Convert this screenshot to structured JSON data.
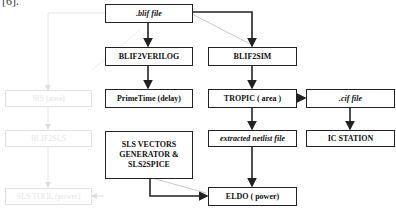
{
  "reference_fragment": "[6].",
  "nodes": {
    "blif_file": {
      "label": ".blif file"
    },
    "blif2verilog": {
      "label": "BLIF2VERILOG"
    },
    "primetime": {
      "label": "PrimeTime (delay)"
    },
    "blif2sim": {
      "label": "BLIF2SIM"
    },
    "tropic": {
      "label": "TROPIC ( area )"
    },
    "cif_file": {
      "label": ".cif file"
    },
    "extracted_netlist": {
      "label": "extracted  netlist file"
    },
    "ic_station": {
      "label": "IC STATION"
    },
    "sls_vectors": {
      "label": "SLS VECTORS GENERATOR & SLS2SPICE"
    },
    "eldo": {
      "label": "ELDO ( power)"
    },
    "ghost_1": {
      "label": "SIS (area)"
    },
    "ghost_2": {
      "label": "BLIF2SLS"
    },
    "ghost_3": {
      "label": "SLS TOOL (power)"
    }
  },
  "edges": [
    {
      "from": ".blif file",
      "to": "BLIF2VERILOG"
    },
    {
      "from": ".blif file",
      "to": "BLIF2SIM"
    },
    {
      "from": "BLIF2VERILOG",
      "to": "PrimeTime (delay)"
    },
    {
      "from": "BLIF2SIM",
      "to": "TROPIC ( area )"
    },
    {
      "from": "TROPIC ( area )",
      "to": ".cif file"
    },
    {
      "from": "TROPIC ( area )",
      "to": "extracted netlist file"
    },
    {
      "from": ".cif file",
      "to": "IC STATION"
    },
    {
      "from": "extracted netlist file",
      "to": "ELDO ( power)"
    },
    {
      "from": "SLS VECTORS GENERATOR & SLS2SPICE",
      "to": "ELDO ( power)"
    },
    {
      "from": "SIS (area)",
      "to": "BLIF2SLS",
      "faded": true
    },
    {
      "from": "BLIF2SLS",
      "to": "SLS TOOL (power)",
      "faded": true
    }
  ],
  "colors": {
    "line": "#222222",
    "faded": "#e2e2e2",
    "background": "#ffffff"
  }
}
